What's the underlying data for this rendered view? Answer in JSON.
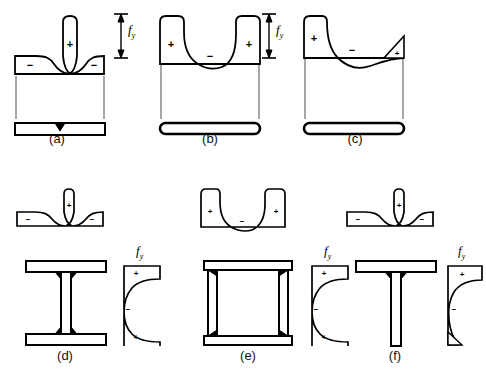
{
  "figure": {
    "background_color": "#ffffff",
    "line_color": "#000000",
    "stress_label": "f",
    "stress_label_sub": "y",
    "sign_positive": "+",
    "sign_negative": "−"
  },
  "panels": [
    {
      "id": "a",
      "caption": "(a)",
      "section_type": "flat-plate-center-weld",
      "stress_pattern": "central tension peak with compression at plate edges",
      "signs": [
        {
          "label": "+",
          "position": "center-peak"
        },
        {
          "label": "−",
          "position": "left-edge"
        },
        {
          "label": "−",
          "position": "right-edge"
        }
      ],
      "has_fy_dimension": true
    },
    {
      "id": "b",
      "caption": "(b)",
      "section_type": "flat-plate-rounded-ends",
      "stress_pattern": "tension at both edges with compression across the middle",
      "signs": [
        {
          "label": "+",
          "position": "left-edge"
        },
        {
          "label": "+",
          "position": "right-edge"
        },
        {
          "label": "−",
          "position": "center"
        }
      ],
      "has_fy_dimension": true
    },
    {
      "id": "c",
      "caption": "(c)",
      "section_type": "flat-plate-rounded-ends",
      "stress_pattern": "tension at left edge, compression through middle, small tension spike at right edge",
      "signs": [
        {
          "label": "+",
          "position": "left-edge"
        },
        {
          "label": "−",
          "position": "center"
        },
        {
          "label": "+",
          "position": "right-edge-spike"
        }
      ],
      "has_fy_dimension": true
    },
    {
      "id": "d",
      "caption": "(d)",
      "section_type": "welded-i-beam",
      "stress_pattern": "flange: tension at web junction, compression at flange tips; web: tension at ends, compression in middle",
      "signs": [
        {
          "label": "+",
          "position": "flange-center"
        },
        {
          "label": "−",
          "position": "flange-left"
        },
        {
          "label": "−",
          "position": "flange-right"
        },
        {
          "label": "+",
          "position": "web-top"
        },
        {
          "label": "−",
          "position": "web-middle"
        },
        {
          "label": "+",
          "position": "web-bottom"
        }
      ],
      "has_fy_dimension": true
    },
    {
      "id": "e",
      "caption": "(e)",
      "section_type": "welded-box-section",
      "stress_pattern": "tension at plate corners, compression across plate middles",
      "signs": [
        {
          "label": "+",
          "position": "flange-left"
        },
        {
          "label": "+",
          "position": "flange-right"
        },
        {
          "label": "−",
          "position": "flange-center"
        },
        {
          "label": "+",
          "position": "web-top"
        },
        {
          "label": "−",
          "position": "web-middle"
        },
        {
          "label": "+",
          "position": "web-bottom"
        }
      ],
      "has_fy_dimension": true
    },
    {
      "id": "f",
      "caption": "(f)",
      "section_type": "welded-tee-section",
      "stress_pattern": "flange: tension at stem junction, compression at tips; stem: tension at top, compression lower with small tip spike",
      "signs": [
        {
          "label": "+",
          "position": "flange-center"
        },
        {
          "label": "−",
          "position": "flange-left"
        },
        {
          "label": "−",
          "position": "flange-right"
        },
        {
          "label": "+",
          "position": "stem-top"
        },
        {
          "label": "−",
          "position": "stem-middle"
        }
      ],
      "has_fy_dimension": true
    }
  ]
}
